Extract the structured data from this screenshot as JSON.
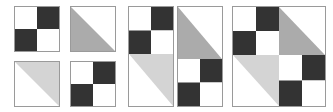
{
  "figure": {
    "background_color": "#ffffff",
    "width": 333,
    "height": 112
  },
  "palette": {
    "dark": "#333333",
    "medium_gray": "#ababab",
    "light_gray": "#d4d4d4",
    "white": "#ffffff",
    "border": "#9a9a9a"
  },
  "patch_types": {
    "four_patch": "four-patch-checkerboard",
    "half_square_medium": "half-square-triangle-medium-lower-left",
    "half_square_light": "half-square-triangle-light-upper-right"
  },
  "groups": [
    {
      "name": "separate-units",
      "label": "Step 1 — four separate units",
      "x": 14,
      "y": 6,
      "width": 102,
      "height": 101,
      "layout": "loose-2x2",
      "panels": [
        {
          "name": "unit-top-left",
          "x": 0,
          "y": 0,
          "w": 46,
          "h": 46,
          "tiles": [
            {
              "name": "four-patch",
              "type": "four_patch",
              "x": 0,
              "y": 0,
              "w": 44,
              "h": 44,
              "cells": [
                "white",
                "dark",
                "dark",
                "white"
              ]
            }
          ]
        },
        {
          "name": "unit-top-right",
          "x": 56,
          "y": 0,
          "w": 46,
          "h": 46,
          "tiles": [
            {
              "name": "half-square-triangle",
              "type": "half_square_medium",
              "x": 0,
              "y": 0,
              "w": 44,
              "h": 44,
              "fill": "medium_gray",
              "corner": "lower-left"
            }
          ]
        },
        {
          "name": "unit-bottom-left",
          "x": 0,
          "y": 55,
          "w": 46,
          "h": 46,
          "tiles": [
            {
              "name": "half-square-triangle",
              "type": "half_square_light",
              "x": 0,
              "y": 0,
              "w": 44,
              "h": 44,
              "fill": "light_gray",
              "corner": "upper-right"
            }
          ]
        },
        {
          "name": "unit-bottom-right",
          "x": 56,
          "y": 55,
          "w": 46,
          "h": 46,
          "tiles": [
            {
              "name": "four-patch",
              "type": "four_patch",
              "x": 0,
              "y": 0,
              "w": 44,
              "h": 44,
              "cells": [
                "white",
                "dark",
                "dark",
                "white"
              ]
            }
          ]
        }
      ]
    },
    {
      "name": "joined-pairs",
      "label": "Step 2 — units joined into two columns",
      "x": 128,
      "y": 6,
      "width": 95,
      "height": 101,
      "layout": "two-columns",
      "panels": [
        {
          "name": "column-left",
          "x": 0,
          "y": 0,
          "w": 46,
          "h": 101,
          "tiles": [
            {
              "name": "four-patch",
              "type": "four_patch",
              "x": 0,
              "y": 0,
              "w": 44,
              "h": 47,
              "cells": [
                "white",
                "dark",
                "dark",
                "white"
              ]
            },
            {
              "name": "half-square-triangle",
              "type": "half_square_light",
              "x": 0,
              "y": 47,
              "w": 44,
              "h": 52,
              "fill": "light_gray",
              "corner": "upper-right"
            }
          ]
        },
        {
          "name": "column-right",
          "x": 49,
          "y": 0,
          "w": 46,
          "h": 101,
          "tiles": [
            {
              "name": "half-square-triangle",
              "type": "half_square_medium",
              "x": 0,
              "y": 0,
              "w": 44,
              "h": 52,
              "fill": "medium_gray",
              "corner": "lower-left"
            },
            {
              "name": "four-patch",
              "type": "four_patch",
              "x": 0,
              "y": 52,
              "w": 44,
              "h": 47,
              "cells": [
                "white",
                "dark",
                "dark",
                "white"
              ]
            }
          ]
        }
      ]
    },
    {
      "name": "completed-block",
      "label": "Step 3 — completed block",
      "x": 232,
      "y": 6,
      "width": 94,
      "height": 101,
      "layout": "single-block-2x2",
      "panels": [
        {
          "name": "finished-block",
          "x": 0,
          "y": 0,
          "w": 94,
          "h": 101,
          "tiles": [
            {
              "name": "four-patch",
              "type": "four_patch",
              "x": 0,
              "y": 0,
              "w": 46,
              "h": 48,
              "cells": [
                "white",
                "dark",
                "dark",
                "white"
              ]
            },
            {
              "name": "half-square-triangle",
              "type": "half_square_medium",
              "x": 46,
              "y": 0,
              "w": 46,
              "h": 48,
              "fill": "medium_gray",
              "corner": "lower-left"
            },
            {
              "name": "half-square-triangle",
              "type": "half_square_light",
              "x": 0,
              "y": 48,
              "w": 46,
              "h": 51,
              "fill": "light_gray",
              "corner": "upper-right"
            },
            {
              "name": "four-patch",
              "type": "four_patch",
              "x": 46,
              "y": 48,
              "w": 46,
              "h": 51,
              "cells": [
                "white",
                "dark",
                "dark",
                "white"
              ]
            }
          ]
        }
      ]
    }
  ]
}
